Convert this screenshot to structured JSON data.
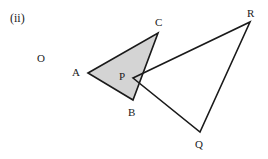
{
  "figure": {
    "part_label": "(ii)",
    "origin_label": "O",
    "shaded_fill": "#d4d4d4",
    "stroke_color": "#1a1a1a",
    "background": "#ffffff",
    "stroke_width": 1.6,
    "shaded_triangle": {
      "name": "triangle-abc",
      "vertices": [
        {
          "label": "A",
          "x": 88,
          "y": 73,
          "label_x": 72,
          "label_y": 67
        },
        {
          "label": "C",
          "x": 158,
          "y": 33,
          "label_x": 155,
          "label_y": 17
        },
        {
          "label": "B",
          "x": 133,
          "y": 100,
          "label_x": 128,
          "label_y": 107
        }
      ],
      "points_path": "88,73 158,33 133,100"
    },
    "outline_triangle": {
      "name": "triangle-pqr",
      "vertices": [
        {
          "label": "P",
          "x": 133,
          "y": 78,
          "label_x": 119,
          "label_y": 71
        },
        {
          "label": "R",
          "x": 250,
          "y": 22,
          "label_x": 247,
          "label_y": 8
        },
        {
          "label": "Q",
          "x": 200,
          "y": 132,
          "label_x": 195,
          "label_y": 139
        }
      ],
      "points_path": "133,78 250,22 200,132"
    }
  }
}
